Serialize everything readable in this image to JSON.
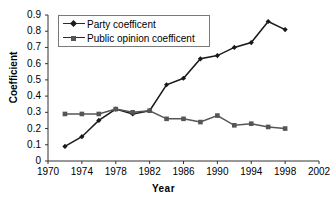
{
  "chart_data": {
    "type": "line",
    "title": "",
    "xlabel": "Year",
    "ylabel": "Coefficient",
    "xlim": [
      1970,
      2002
    ],
    "ylim": [
      0,
      0.9
    ],
    "grid": false,
    "legend_position": "upper-left",
    "x": [
      1972,
      1974,
      1976,
      1978,
      1980,
      1982,
      1984,
      1986,
      1988,
      1990,
      1992,
      1994,
      1996,
      1998
    ],
    "xticks": [
      "1970",
      "1974",
      "1978",
      "1982",
      "1986",
      "1990",
      "1994",
      "1998",
      "2002"
    ],
    "xtick_values": [
      1970,
      1974,
      1978,
      1982,
      1986,
      1990,
      1994,
      1998,
      2002
    ],
    "yticks": [
      "0",
      "0.1",
      "0.2",
      "0.3",
      "0.4",
      "0.5",
      "0.6",
      "0.7",
      "0.8",
      "0.9"
    ],
    "ytick_values": [
      0,
      0.1,
      0.2,
      0.3,
      0.4,
      0.5,
      0.6,
      0.7,
      0.8,
      0.9
    ],
    "series": [
      {
        "name": "Party coefficent",
        "marker": "diamond",
        "color": "#1a1a1a",
        "values": [
          0.09,
          0.15,
          0.25,
          0.32,
          0.29,
          0.31,
          0.47,
          0.51,
          0.63,
          0.65,
          0.7,
          0.73,
          0.86,
          0.81
        ]
      },
      {
        "name": "Public opinion coefficent",
        "marker": "square",
        "color": "#555555",
        "values": [
          0.29,
          0.29,
          0.29,
          0.32,
          0.3,
          0.31,
          0.26,
          0.26,
          0.24,
          0.28,
          0.22,
          0.23,
          0.21,
          0.2
        ]
      }
    ]
  },
  "legend": {
    "items": [
      {
        "label": "Party coefficent"
      },
      {
        "label": "Public opinion coefficent"
      }
    ]
  },
  "axes": {
    "x_title": "Year",
    "y_title": "Coefficient"
  }
}
